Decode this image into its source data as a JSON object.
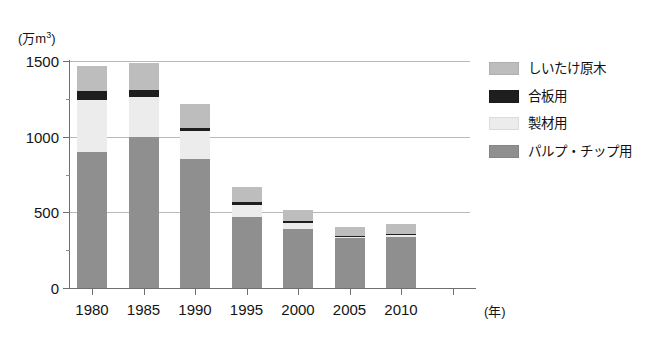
{
  "chart_data": {
    "type": "bar",
    "subtype": "stacked-vertical",
    "title": "",
    "xlabel": "(年)",
    "ylabel": "(万m3)",
    "ylabel_unit_prefix": "(万m",
    "ylabel_unit_sup": "3",
    "ylabel_unit_suffix": ")",
    "categories": [
      "1980",
      "1985",
      "1990",
      "1995",
      "2000",
      "2005",
      "2010"
    ],
    "ylim": [
      0,
      1500
    ],
    "yticks": [
      0,
      500,
      1000,
      1500
    ],
    "ytick_labels": [
      "0",
      "500",
      "1000",
      "1500"
    ],
    "grid": true,
    "grid_axis": "y",
    "legend_position": "right",
    "stack_order_bottom_to_top": [
      "パルプ・チップ用",
      "製材用",
      "合板用",
      "しいたけ原木"
    ],
    "series": [
      {
        "name": "パルプ・チップ用",
        "key": "pulp",
        "color": "#8f8f8f",
        "values": [
          900,
          1000,
          850,
          470,
          390,
          330,
          340
        ]
      },
      {
        "name": "製材用",
        "key": "lumber",
        "color": "#ececec",
        "values": [
          340,
          260,
          185,
          80,
          40,
          10,
          10
        ]
      },
      {
        "name": "合板用",
        "key": "plywood",
        "color": "#1e1e1e",
        "values": [
          60,
          50,
          25,
          20,
          10,
          5,
          5
        ]
      },
      {
        "name": "しいたけ原木",
        "key": "shiitake",
        "color": "#bdbdbd",
        "values": [
          170,
          180,
          155,
          95,
          75,
          60,
          70
        ]
      }
    ],
    "totals": [
      1470,
      1490,
      1215,
      665,
      515,
      405,
      425
    ]
  },
  "legend": {
    "items": [
      {
        "label": "しいたけ原木",
        "color": "#bdbdbd",
        "key": "shiitake"
      },
      {
        "label": "合板用",
        "color": "#1e1e1e",
        "key": "plywood"
      },
      {
        "label": "製材用",
        "color": "#ececec",
        "key": "lumber"
      },
      {
        "label": "パルプ・チップ用",
        "color": "#8f8f8f",
        "key": "pulp"
      }
    ]
  },
  "axes": {
    "y_unit_text": "(万m",
    "y_unit_sup": "3",
    "y_unit_close": ")",
    "x_title": "(年)"
  }
}
